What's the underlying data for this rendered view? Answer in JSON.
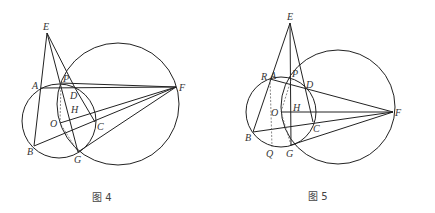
{
  "figures": [
    {
      "caption": "图 4",
      "labels": {
        "E": "E",
        "A": "A",
        "P": "P",
        "D": "D",
        "F": "F",
        "O": "O",
        "H": "H",
        "C": "C",
        "B": "B",
        "G": "G"
      }
    },
    {
      "caption": "图 5",
      "labels": {
        "E": "E",
        "R": "R",
        "A": "A",
        "P": "P",
        "D": "D",
        "F": "F",
        "O": "O",
        "H": "H",
        "C": "C",
        "B": "B",
        "G": "G",
        "Q": "Q"
      }
    }
  ]
}
